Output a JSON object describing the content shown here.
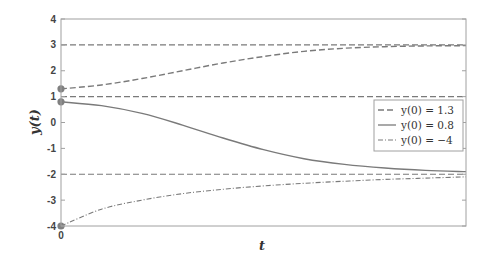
{
  "chart_data": {
    "type": "line",
    "title": "",
    "xlabel": "t",
    "ylabel": "y(t)",
    "ylim": [
      -4,
      4
    ],
    "yticks": [
      -4,
      -3,
      -2,
      -1,
      0,
      1,
      2,
      3,
      4
    ],
    "ytick_labels": [
      "-4",
      "-3",
      "-2",
      "-1",
      "0",
      "1",
      "2",
      "3",
      "4"
    ],
    "xticks": [
      0
    ],
    "xtick_labels": [
      "0"
    ],
    "grid": false,
    "legend_position": "right-center",
    "equilibria": [
      3,
      1,
      -2
    ],
    "x": [
      0,
      0.1,
      0.2,
      0.3,
      0.4,
      0.5,
      0.6,
      0.7,
      0.8,
      0.9,
      1.0
    ],
    "series": [
      {
        "name": "y(0) = 1.3",
        "style": "dashed",
        "initial": 1.3,
        "values": [
          1.3,
          1.45,
          1.7,
          2.0,
          2.3,
          2.55,
          2.75,
          2.87,
          2.93,
          2.96,
          2.97
        ]
      },
      {
        "name": "y(0) = 0.8",
        "style": "solid",
        "initial": 0.8,
        "values": [
          0.8,
          0.65,
          0.35,
          -0.1,
          -0.6,
          -1.05,
          -1.4,
          -1.62,
          -1.76,
          -1.85,
          -1.9
        ]
      },
      {
        "name": "y(0) = -4",
        "style": "dash-dot",
        "initial": -4,
        "values": [
          -4,
          -3.35,
          -3.0,
          -2.75,
          -2.58,
          -2.45,
          -2.35,
          -2.27,
          -2.2,
          -2.15,
          -2.1
        ]
      }
    ]
  },
  "legend": {
    "entries": [
      "y(0) = 1.3",
      "y(0) = 0.8",
      "y(0) = −4"
    ]
  },
  "axes": {
    "xlabel": "t",
    "ylabel": "y(t)"
  },
  "colors": {
    "line": "#7a7a7a",
    "axis": "#9a9a9a",
    "marker": "#808080"
  }
}
